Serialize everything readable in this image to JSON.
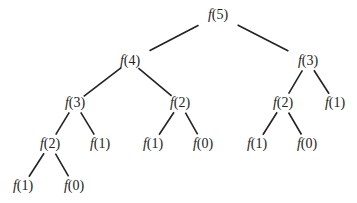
{
  "nodes": [
    {
      "id": "n0",
      "fn": "f",
      "arg": "5",
      "x": 218,
      "y": 15
    },
    {
      "id": "n1",
      "fn": "f",
      "arg": "4",
      "x": 130,
      "y": 61
    },
    {
      "id": "n2",
      "fn": "f",
      "arg": "3",
      "x": 308,
      "y": 61
    },
    {
      "id": "n3",
      "fn": "f",
      "arg": "3",
      "x": 75,
      "y": 103
    },
    {
      "id": "n4",
      "fn": "f",
      "arg": "2",
      "x": 180,
      "y": 103
    },
    {
      "id": "n5",
      "fn": "f",
      "arg": "2",
      "x": 283,
      "y": 103
    },
    {
      "id": "n6",
      "fn": "f",
      "arg": "1",
      "x": 335,
      "y": 103
    },
    {
      "id": "n7",
      "fn": "f",
      "arg": "2",
      "x": 50,
      "y": 144
    },
    {
      "id": "n8",
      "fn": "f",
      "arg": "1",
      "x": 100,
      "y": 144
    },
    {
      "id": "n9",
      "fn": "f",
      "arg": "1",
      "x": 153,
      "y": 144
    },
    {
      "id": "n10",
      "fn": "f",
      "arg": "0",
      "x": 203,
      "y": 144
    },
    {
      "id": "n11",
      "fn": "f",
      "arg": "1",
      "x": 257,
      "y": 144
    },
    {
      "id": "n12",
      "fn": "f",
      "arg": "0",
      "x": 307,
      "y": 144
    },
    {
      "id": "n13",
      "fn": "f",
      "arg": "1",
      "x": 23,
      "y": 186
    },
    {
      "id": "n14",
      "fn": "f",
      "arg": "0",
      "x": 74,
      "y": 186
    }
  ],
  "edges": [
    [
      "n0",
      "n1"
    ],
    [
      "n0",
      "n2"
    ],
    [
      "n1",
      "n3"
    ],
    [
      "n1",
      "n4"
    ],
    [
      "n2",
      "n5"
    ],
    [
      "n2",
      "n6"
    ],
    [
      "n3",
      "n7"
    ],
    [
      "n3",
      "n8"
    ],
    [
      "n4",
      "n9"
    ],
    [
      "n4",
      "n10"
    ],
    [
      "n5",
      "n11"
    ],
    [
      "n5",
      "n12"
    ],
    [
      "n7",
      "n13"
    ],
    [
      "n7",
      "n14"
    ]
  ],
  "style": {
    "line_color": "#222222",
    "text_color": "#222222"
  }
}
